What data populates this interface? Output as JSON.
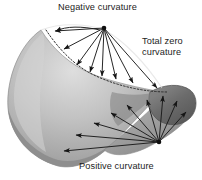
{
  "figure": {
    "title_absent": "",
    "background_color": "#ffffff",
    "labels": {
      "negative": "Negative curvature",
      "total_zero_line1": "Total zero",
      "total_zero_line2": "curvature",
      "positive": "Positive curvature"
    },
    "colors": {
      "surface_light": "#d9d9d9",
      "surface_mid": "#a3a3a3",
      "surface_dark": "#6e6e6e",
      "surface_darkest": "#575757",
      "outline": "#4a4a4a",
      "arrow": "#1a1a1a",
      "text": "#1d1d1d"
    },
    "geometry": {
      "upper_vertex": [
        104,
        28
      ],
      "lower_vertex": [
        159,
        142
      ],
      "upper_arrow_targets": [
        [
          52,
          32
        ],
        [
          62,
          51
        ],
        [
          74,
          67
        ],
        [
          88,
          74
        ],
        [
          101,
          78
        ],
        [
          115,
          81
        ],
        [
          132,
          85
        ],
        [
          158,
          90
        ]
      ],
      "lower_arrow_targets": [
        [
          61,
          152
        ],
        [
          74,
          135
        ],
        [
          92,
          122
        ],
        [
          109,
          112
        ],
        [
          125,
          104
        ],
        [
          146,
          98
        ],
        [
          162,
          94
        ],
        [
          176,
          99
        ],
        [
          186,
          110
        ]
      ]
    }
  }
}
